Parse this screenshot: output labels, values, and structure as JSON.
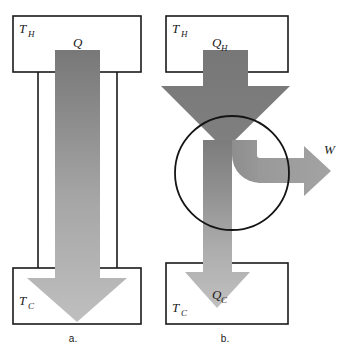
{
  "figure": {
    "background": "#ffffff",
    "outline_color": "#1a1a1a"
  },
  "colors": {
    "arrow_dark": "#7b7b7b",
    "arrow_mid": "#9a9a9a",
    "arrow_light": "#bcbcbc",
    "outline": "#1a1a1a",
    "box_fill": "#ffffff",
    "notch_fill": "#ffffff"
  },
  "panels": [
    {
      "id": "a",
      "caption": "a.",
      "hot_reservoir": {
        "label": "T",
        "subscript": "H"
      },
      "cold_reservoir": {
        "label": "T",
        "subscript": "C"
      },
      "flows": [
        {
          "name": "heat-flow",
          "label": "Q",
          "subscript": "",
          "direction": "down"
        }
      ]
    },
    {
      "id": "b",
      "caption": "b.",
      "hot_reservoir": {
        "label": "T",
        "subscript": "H"
      },
      "cold_reservoir": {
        "label": "T",
        "subscript": "C"
      },
      "flows": [
        {
          "name": "heat-input",
          "label": "Q",
          "subscript": "H",
          "direction": "down"
        },
        {
          "name": "work-output",
          "label": "W",
          "subscript": "",
          "direction": "right"
        },
        {
          "name": "heat-rejected",
          "label": "Q",
          "subscript": "C",
          "direction": "down"
        }
      ]
    }
  ]
}
